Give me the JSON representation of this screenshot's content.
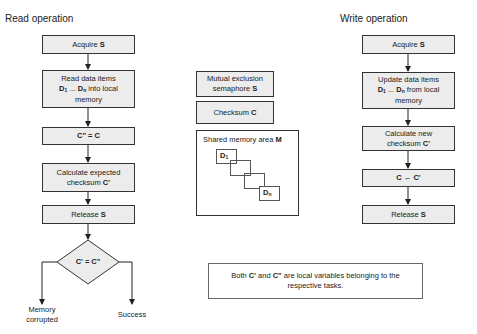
{
  "read": {
    "title": "Read operation",
    "steps": [
      {
        "pre": "Acquire ",
        "bold": "S"
      },
      {
        "line1": "Read data items",
        "d1": "D",
        "d1sub": "1",
        "ellipsis": " ... ",
        "dn": "D",
        "dnsub": "n",
        "rest": " into local",
        "line3": "memory"
      },
      {
        "bold": "C\" = C"
      },
      {
        "line1": "Calculate expected",
        "pre": "checksum ",
        "bold": "C'"
      },
      {
        "pre": "Release ",
        "bold": "S"
      }
    ],
    "decision": "C' = C\"",
    "outcomes": {
      "left": "Memory corrupted",
      "left1": "Memory",
      "left2": "corrupted",
      "right": "Success"
    }
  },
  "shared": {
    "semaphore": {
      "line1": "Mutual exclusion",
      "pre": "semaphore ",
      "bold": "S"
    },
    "checksum": {
      "pre": "Checksum ",
      "bold": "C"
    },
    "memory": {
      "pre": "Shared memory area ",
      "bold": "M",
      "first": "D",
      "first_sub": "1",
      "last": "D",
      "last_sub": "n"
    }
  },
  "write": {
    "title": "Write operation",
    "steps": [
      {
        "pre": "Acquire ",
        "bold": "S"
      },
      {
        "line1": "Update data items",
        "d1": "D",
        "d1sub": "1",
        "ellipsis": " ... ",
        "dn": "D",
        "dnsub": "n",
        "rest": " from local",
        "line3": "memory"
      },
      {
        "line1": "Calculate new",
        "pre": "checksum ",
        "bold": "C'"
      },
      {
        "bold": "C ← C'"
      },
      {
        "pre": "Release ",
        "bold": "S"
      }
    ]
  },
  "note": {
    "pre": "Both ",
    "b1": "C'",
    "mid": " and ",
    "b2": "C\"",
    "rest": " are local variables belonging to the",
    "line2": "respective tasks."
  }
}
